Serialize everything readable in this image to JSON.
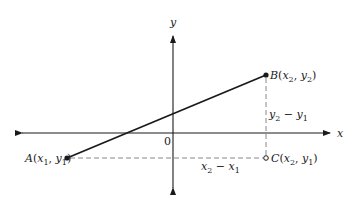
{
  "diagram": {
    "type": "coordinate-geometry",
    "axes": {
      "x_label": "x",
      "y_label": "y",
      "origin_label": "0"
    },
    "points": {
      "A": {
        "name": "A",
        "coords": "x1, y1",
        "x_sub": "1",
        "y_sub": "1"
      },
      "B": {
        "name": "B",
        "coords": "x2, y2",
        "x_sub": "2",
        "y_sub": "2"
      },
      "C": {
        "name": "C",
        "coords": "x2, y1",
        "x_sub": "2",
        "y_sub": "1"
      }
    },
    "segments": {
      "horizontal_label": {
        "a": "x",
        "a_sub": "2",
        "minus": " − ",
        "b": "x",
        "b_sub": "1"
      },
      "vertical_label": {
        "a": "y",
        "a_sub": "2",
        "minus": " − ",
        "b": "y",
        "b_sub": "1"
      }
    },
    "colors": {
      "line": "#1a1a1a",
      "dashed": "#888888"
    }
  }
}
